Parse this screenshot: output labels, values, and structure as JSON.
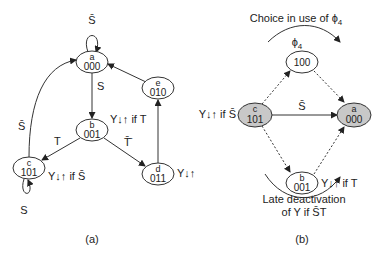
{
  "diagram_a": {
    "caption": "(a)",
    "nodes": [
      {
        "id": "a",
        "code": "000"
      },
      {
        "id": "b",
        "code": "001"
      },
      {
        "id": "c",
        "code": "101"
      },
      {
        "id": "d",
        "code": "011"
      },
      {
        "id": "e",
        "code": "010"
      }
    ],
    "edges": {
      "a_self": "S̄",
      "a_b": "S",
      "b_c": "T",
      "b_d": "T̄̄",
      "c_a": "S̄",
      "c_self": "S"
    },
    "annotations": {
      "b": "Y↓↑ if T",
      "c": "Y↓↑ if S̄",
      "d": "Y↓↑"
    }
  },
  "diagram_b": {
    "caption": "(b)",
    "nodes": [
      {
        "id": "",
        "code": "100",
        "label": "ϕ4",
        "shaded": false
      },
      {
        "id": "c",
        "code": "101",
        "shaded": true
      },
      {
        "id": "a",
        "code": "000",
        "shaded": true
      },
      {
        "id": "b",
        "code": "001",
        "shaded": false
      }
    ],
    "edge_c_a": "S̄",
    "annotations": {
      "c": "Y↓↑ if S̄",
      "b": "Y↓↑ if T",
      "top": "Choice in use of ϕ",
      "top_sub": "4",
      "phi": "ϕ",
      "phi_sub": "4",
      "bottom_line1": "Late deactivation",
      "bottom_line2": "of Y if S̄T"
    }
  },
  "colors": {
    "stroke": "#333333",
    "shaded_fill": "#c8c8c8",
    "text": "#222222"
  }
}
